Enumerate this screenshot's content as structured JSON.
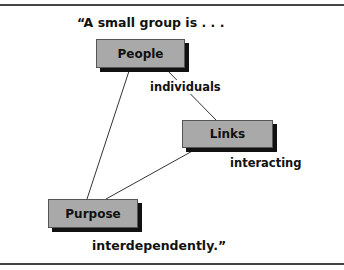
{
  "diagram": {
    "quote_open": "“A small group is . . .",
    "quote_close": "interdependently.”",
    "nodes": {
      "people": "People",
      "links": "Links",
      "purpose": "Purpose"
    },
    "edge_labels": {
      "individuals": "individuals",
      "interacting": "interacting"
    },
    "edges": [
      {
        "from": "People",
        "to": "Purpose"
      },
      {
        "from": "People",
        "to": "Links",
        "label": "individuals"
      },
      {
        "from": "Links",
        "to": "Purpose"
      }
    ],
    "colors": {
      "node_fill": "#a9a9a9",
      "node_shadow": "#111111",
      "line": "#333333",
      "rule": "#444444"
    }
  }
}
